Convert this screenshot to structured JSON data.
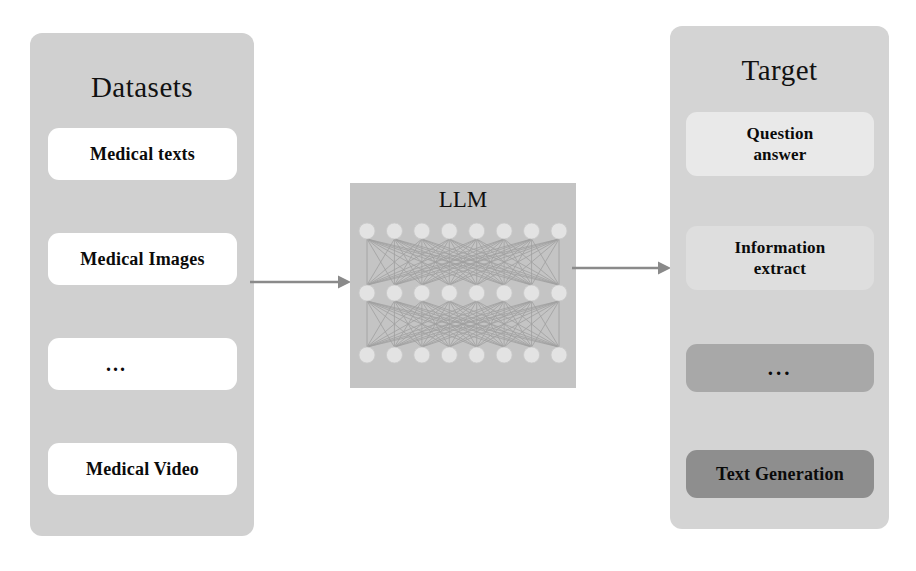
{
  "diagram": {
    "panels": {
      "datasets": {
        "title": "Datasets",
        "items": [
          {
            "label": "Medical texts",
            "fill": "#ffffff"
          },
          {
            "label": "Medical Images",
            "fill": "#ffffff"
          },
          {
            "label": "...",
            "fill": "#ffffff"
          },
          {
            "label": "Medical Video",
            "fill": "#ffffff"
          }
        ],
        "panel_fill": "#d0d0d0"
      },
      "model": {
        "title": "LLM",
        "panel_fill": "#c4c4c4",
        "network": {
          "layers": 3,
          "nodes_per_layer": 8,
          "node_fill": "#e3e3e3",
          "edge_color": "#9a9a9a",
          "fully_connected": true
        }
      },
      "target": {
        "title": "Target",
        "items": [
          {
            "label": "Question\nanswer",
            "fill": "#e9e9e9"
          },
          {
            "label": "Information\nextract",
            "fill": "#dedede"
          },
          {
            "label": "...",
            "fill": "#a8a8a8"
          },
          {
            "label": "Text Generation",
            "fill": "#8e8e8e"
          }
        ],
        "panel_fill": "#d4d4d4"
      }
    },
    "arrows": [
      {
        "name": "datasets-to-llm",
        "from": "datasets",
        "to": "model",
        "color": "#8a8a8a"
      },
      {
        "name": "llm-to-target",
        "from": "model",
        "to": "target",
        "color": "#8a8a8a"
      }
    ],
    "colors": {
      "background": "#ffffff",
      "text": "#0a0a0a",
      "arrow": "#8a8a8a"
    }
  }
}
